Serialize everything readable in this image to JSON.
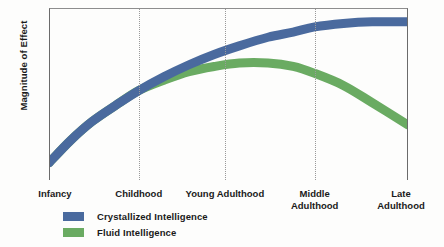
{
  "chart_data": {
    "type": "line",
    "title": "",
    "xlabel": "",
    "ylabel": "Magnitude of Effect",
    "grid": true,
    "legend_position": "bottom-left",
    "x_categories": [
      "Infancy",
      "Childhood",
      "Young Adulthood",
      "Middle Adulthood",
      "Late Adulthood"
    ],
    "x_tick_positions_pct": [
      0,
      25,
      49,
      74,
      100
    ],
    "ylim": [
      0,
      100
    ],
    "xlim": [
      0,
      100
    ],
    "series": [
      {
        "name": "Crystallized Intelligence",
        "color": "#4a6a9e",
        "x": [
          0,
          6,
          12,
          19,
          25,
          32,
          39,
          46,
          53,
          61,
          68,
          74,
          82,
          90,
          100
        ],
        "values": [
          10,
          23,
          34,
          44,
          52,
          60,
          67,
          73,
          78,
          83,
          86,
          89,
          91,
          92,
          92
        ]
      },
      {
        "name": "Fluid Intelligence",
        "color": "#6aab62",
        "x": [
          0,
          6,
          12,
          19,
          25,
          32,
          39,
          46,
          53,
          61,
          68,
          74,
          82,
          90,
          100
        ],
        "values": [
          10,
          23,
          34,
          44,
          52,
          58,
          63,
          66,
          68,
          68,
          66,
          62,
          55,
          45,
          32
        ]
      }
    ],
    "annotations": [
      "Crystallized and fluid intelligence rise together through childhood",
      "Fluid intelligence peaks in young adulthood then declines",
      "Crystallized intelligence plateaus in late adulthood"
    ]
  },
  "axis": {
    "y_title": "Magnitude of Effect",
    "ticks": [
      {
        "label": "Infancy",
        "left_pct": 0
      },
      {
        "label": "Childhood",
        "left_pct": 25
      },
      {
        "label": "Young Adulthood",
        "left_pct": 49
      },
      {
        "label": "Middle\nAdulthood",
        "left_pct": 74
      },
      {
        "label": "Late\nAdulthood",
        "left_pct": 100
      }
    ]
  },
  "legend": {
    "items": [
      {
        "label": "Crystallized Intelligence",
        "color": "#4a6a9e"
      },
      {
        "label": "Fluid Intelligence",
        "color": "#6aab62"
      }
    ]
  },
  "colors": {
    "crystallized": "#4a6a9e",
    "fluid": "#6aab62",
    "axis": "#6b6b6b",
    "gridline": "#9a9a9a",
    "text": "#1a1a1a",
    "background": "#fdfdfc"
  }
}
